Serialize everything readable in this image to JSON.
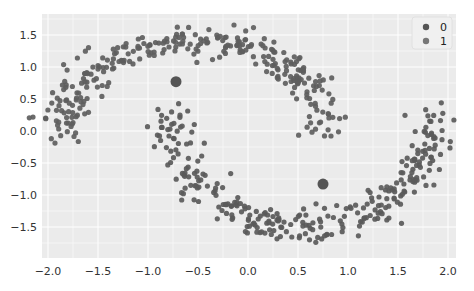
{
  "chart_data": {
    "type": "scatter",
    "title": "",
    "xlabel": "",
    "ylabel": "",
    "xlim": [
      -2.06,
      2.08
    ],
    "ylim": [
      -1.86,
      1.83
    ],
    "grid": true,
    "style": "seaborn-darkgrid (light gray background, white grid lines)",
    "x_ticks": [
      "-2.0",
      "-1.5",
      "-1.0",
      "-0.5",
      "0.0",
      "0.5",
      "1.0",
      "1.5",
      "2.0"
    ],
    "y_ticks": [
      "1.5",
      "1.0",
      "0.5",
      "0.0",
      "-0.5",
      "-1.0",
      "-1.5"
    ],
    "legend": {
      "position": "upper right",
      "entries": [
        "0",
        "1"
      ]
    },
    "series": [
      {
        "name": "0",
        "description": "upper moon (make_moons class 0), arc from (-1.85,-0.4) up through (-0.3,1.5) down to (0.75,-0.5)",
        "color": "#5a5a5a"
      },
      {
        "name": "1",
        "description": "lower moon (make_moons class 1), arc from (-0.75,0.3) down through (0.3,-1.55) up to (1.85,0.5)",
        "color": "#6e6e6e"
      }
    ],
    "highlighted_points": [
      {
        "x": -0.72,
        "y": 0.77,
        "label": "large marker",
        "color": "#555555"
      },
      {
        "x": 0.75,
        "y": -0.83,
        "label": "large marker",
        "color": "#555555"
      }
    ],
    "points_per_series_approx": 300
  },
  "plot": {
    "background": "#ebebeb",
    "grid_color": "#ffffff",
    "point_color": "#5c5c5c",
    "legend_bg": "#f0f0f0"
  }
}
